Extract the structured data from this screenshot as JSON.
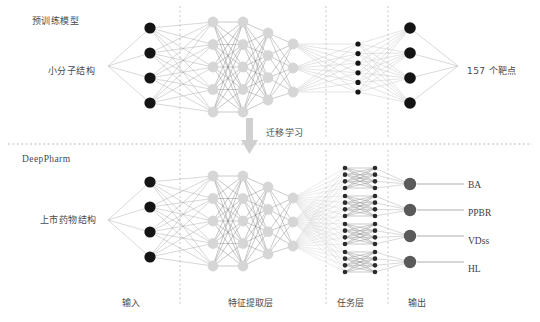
{
  "figure": {
    "title_top": "预训练模型",
    "title_bottom": "DeepPharm",
    "transfer_label": "迁移学习"
  },
  "top_network": {
    "input_label": "小分子结构",
    "output_label": "157 个靶点",
    "layers": [
      {
        "name": "input",
        "nodes": 4,
        "style": "dark-large"
      },
      {
        "name": "feature-1",
        "nodes": 5,
        "style": "light-large"
      },
      {
        "name": "feature-2",
        "nodes": 5,
        "style": "light-large"
      },
      {
        "name": "feature-3",
        "nodes": 4,
        "style": "light-large"
      },
      {
        "name": "feature-4",
        "nodes": 3,
        "style": "light-large"
      },
      {
        "name": "task",
        "nodes": 6,
        "style": "dark-small"
      },
      {
        "name": "output",
        "nodes": 4,
        "style": "dark-large"
      }
    ]
  },
  "bottom_network": {
    "input_label": "上市药物结构",
    "layers": [
      {
        "name": "input",
        "nodes": 4,
        "style": "dark-large"
      },
      {
        "name": "feature-1",
        "nodes": 5,
        "style": "light-large"
      },
      {
        "name": "feature-2",
        "nodes": 5,
        "style": "light-large"
      },
      {
        "name": "feature-3",
        "nodes": 4,
        "style": "light-large"
      },
      {
        "name": "feature-4",
        "nodes": 3,
        "style": "light-large"
      },
      {
        "name": "task-group-a",
        "nodes": 4,
        "style": "dark-small"
      },
      {
        "name": "task-group-b",
        "nodes": 4,
        "style": "dark-small"
      },
      {
        "name": "output",
        "nodes": 4,
        "style": "gray-large"
      }
    ],
    "outputs": [
      "BA",
      "PPBR",
      "VDss",
      "HL"
    ]
  },
  "axis_labels": [
    {
      "key": "input",
      "text": "输入"
    },
    {
      "key": "feature-extraction",
      "text": "特征提取层"
    },
    {
      "key": "task-layer",
      "text": "任务层"
    },
    {
      "key": "output",
      "text": "输出"
    }
  ],
  "colors": {
    "node_dark": "#141414",
    "node_light": "#d6d6d6",
    "node_gray": "#5a5a5a",
    "node_small_dark": "#2b2b2b",
    "edge_light": "#c9c9c9",
    "edge_dark": "#555555",
    "divider": "#b8b8b8",
    "arrow": "#d0d0d0",
    "text": "#4a4a4a",
    "background": "#ffffff"
  }
}
